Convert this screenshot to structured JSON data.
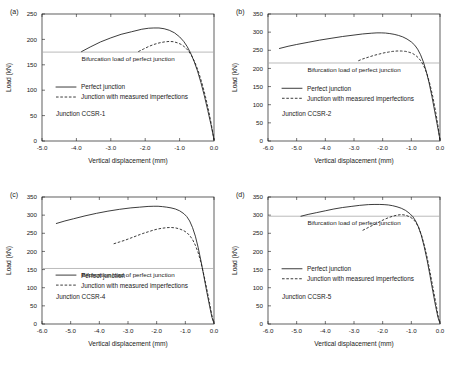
{
  "figure": {
    "background": "#ffffff",
    "axis_color": "#1a1a1a",
    "bifurcation_line_color": "#aaaaaa",
    "panel_labels": [
      "(a)",
      "(b)",
      "(c)",
      "(d)"
    ]
  },
  "chart_data": [
    {
      "type": "line",
      "panel": "(a)",
      "title": "Junction CCSR-1",
      "xlabel": "Vertical displacement (mm)",
      "ylabel": "Load (kN)",
      "xlim": [
        -5.0,
        0.0
      ],
      "ylim": [
        0,
        250
      ],
      "xticks": [
        -5.0,
        -4.0,
        -3.0,
        -2.0,
        -1.0,
        0.0
      ],
      "xticklabels": [
        "-5.0",
        "-4.0",
        "-3.0",
        "-2.0",
        "-1.0",
        "0.0"
      ],
      "yticks": [
        0,
        50,
        100,
        150,
        200,
        250
      ],
      "yticklabels": [
        "0",
        "50",
        "100",
        "150",
        "200",
        "250"
      ],
      "grid": false,
      "legend_position": "center-left",
      "annotations": [
        {
          "text": "Bifurcation load of perfect junction",
          "y_value": 175,
          "type": "hline-label"
        }
      ],
      "bifurcation_load": 175,
      "series": [
        {
          "name": "Perfect junction",
          "style": "solid",
          "x": [
            -3.85,
            -3.6,
            -3.3,
            -3.0,
            -2.7,
            -2.4,
            -2.1,
            -1.9,
            -1.75,
            -1.6,
            -1.45,
            -1.3,
            -1.15,
            -1.0,
            -0.88,
            -0.78,
            -0.68,
            -0.58,
            -0.48,
            -0.38,
            -0.28,
            -0.18,
            -0.09,
            -0.02,
            0.0
          ],
          "y": [
            176,
            185,
            195,
            203,
            210,
            215,
            220,
            222,
            222.5,
            222.5,
            221,
            218,
            213,
            205,
            196,
            186,
            173,
            157,
            138,
            115,
            89,
            60,
            33,
            10,
            2
          ]
        },
        {
          "name": "Junction with measured imperfections",
          "style": "dashed",
          "x": [
            -2.2,
            -2.05,
            -1.9,
            -1.75,
            -1.6,
            -1.45,
            -1.3,
            -1.18,
            -1.05,
            -0.95,
            -0.85,
            -0.75,
            -0.65,
            -0.55,
            -0.45,
            -0.35,
            -0.25,
            -0.15,
            -0.07,
            0.0
          ],
          "y": [
            176,
            181,
            186,
            190,
            193,
            195,
            196,
            195.5,
            193,
            190,
            185,
            178,
            168,
            154,
            136,
            114,
            88,
            58,
            30,
            2
          ]
        }
      ]
    },
    {
      "type": "line",
      "panel": "(b)",
      "title": "Junction CCSR-2",
      "xlabel": "Vertical displacement (mm)",
      "ylabel": "Load (kN)",
      "xlim": [
        -6.0,
        0.0
      ],
      "ylim": [
        0,
        350
      ],
      "xticks": [
        -6.0,
        -5.0,
        -4.0,
        -3.0,
        -2.0,
        -1.0,
        0.0
      ],
      "xticklabels": [
        "-6.0",
        "-5.0",
        "-4.0",
        "-3.0",
        "-2.0",
        "-1.0",
        "0.0"
      ],
      "yticks": [
        0,
        50,
        100,
        150,
        200,
        250,
        300,
        350
      ],
      "yticklabels": [
        "0",
        "50",
        "100",
        "150",
        "200",
        "250",
        "300",
        "350"
      ],
      "grid": false,
      "legend_position": "center-left",
      "annotations": [
        {
          "text": "Bifurcation load of perfect junction",
          "y_value": 215,
          "type": "hline-label"
        }
      ],
      "bifurcation_load": 215,
      "series": [
        {
          "name": "Perfect junction",
          "style": "solid",
          "x": [
            -5.6,
            -5.3,
            -5.0,
            -4.6,
            -4.2,
            -3.8,
            -3.4,
            -3.0,
            -2.7,
            -2.4,
            -2.2,
            -2.05,
            -1.9,
            -1.75,
            -1.6,
            -1.45,
            -1.3,
            -1.15,
            -1.0,
            -0.88,
            -0.78,
            -0.68,
            -0.58,
            -0.48,
            -0.38,
            -0.28,
            -0.18,
            -0.09,
            -0.02,
            0.0
          ],
          "y": [
            255,
            261,
            266,
            272,
            278,
            283,
            288,
            292,
            295,
            297,
            298,
            298,
            297.5,
            296,
            294,
            291,
            287,
            281,
            273,
            264,
            253,
            238,
            218,
            192,
            160,
            122,
            80,
            42,
            12,
            2
          ]
        },
        {
          "name": "Junction with measured imperfections",
          "style": "dashed",
          "x": [
            -2.85,
            -2.7,
            -2.5,
            -2.3,
            -2.1,
            -1.95,
            -1.8,
            -1.65,
            -1.5,
            -1.35,
            -1.2,
            -1.05,
            -0.95,
            -0.85,
            -0.75,
            -0.65,
            -0.55,
            -0.45,
            -0.35,
            -0.25,
            -0.15,
            -0.07,
            0.0
          ],
          "y": [
            221,
            226,
            231,
            236,
            240,
            243,
            245,
            247,
            248,
            248,
            247,
            244,
            241,
            236,
            229,
            219,
            204,
            184,
            156,
            122,
            80,
            42,
            2
          ]
        }
      ]
    },
    {
      "type": "line",
      "panel": "(c)",
      "title": "Junction CCSR-4",
      "xlabel": "Vertical displacement (mm)",
      "ylabel": "Load (kN)",
      "xlim": [
        -6.0,
        0.0
      ],
      "ylim": [
        0,
        350
      ],
      "xticks": [
        -6.0,
        -5.0,
        -4.0,
        -3.0,
        -2.0,
        -1.0,
        0.0
      ],
      "xticklabels": [
        "-6.0",
        "-5.0",
        "-4.0",
        "-3.0",
        "-2.0",
        "-1.0",
        "0.0"
      ],
      "yticks": [
        0,
        50,
        100,
        150,
        200,
        250,
        300,
        350
      ],
      "yticklabels": [
        "0",
        "50",
        "100",
        "150",
        "200",
        "250",
        "300",
        "350"
      ],
      "grid": false,
      "legend_position": "center-left",
      "annotations": [
        {
          "text": "Bifurcation load of perfect junction",
          "y_value": 153,
          "type": "hline-label"
        }
      ],
      "bifurcation_load": 153,
      "series": [
        {
          "name": "Perfect junction",
          "style": "solid",
          "x": [
            -5.5,
            -5.2,
            -4.9,
            -4.5,
            -4.1,
            -3.7,
            -3.3,
            -2.9,
            -2.6,
            -2.3,
            -2.1,
            -1.95,
            -1.8,
            -1.65,
            -1.5,
            -1.35,
            -1.2,
            -1.05,
            -0.95,
            -0.85,
            -0.75,
            -0.65,
            -0.55,
            -0.45,
            -0.35,
            -0.25,
            -0.15,
            -0.07,
            0.0
          ],
          "y": [
            277,
            284,
            290,
            298,
            305,
            311,
            316,
            320,
            322,
            324,
            324.5,
            324.5,
            323.5,
            322,
            320,
            317,
            312,
            304,
            296,
            284,
            266,
            242,
            210,
            172,
            130,
            88,
            48,
            18,
            2
          ]
        },
        {
          "name": "Junction with measured imperfections",
          "style": "dashed",
          "x": [
            -3.5,
            -3.3,
            -3.1,
            -2.9,
            -2.7,
            -2.5,
            -2.3,
            -2.1,
            -1.95,
            -1.8,
            -1.65,
            -1.5,
            -1.35,
            -1.2,
            -1.05,
            -0.95,
            -0.85,
            -0.75,
            -0.65,
            -0.55,
            -0.45,
            -0.35,
            -0.25,
            -0.15,
            -0.07,
            0.0
          ],
          "y": [
            221,
            226,
            231,
            237,
            243,
            249,
            254,
            259,
            262,
            264,
            265.5,
            266,
            265,
            262,
            257,
            252,
            244,
            233,
            217,
            196,
            168,
            134,
            96,
            56,
            22,
            2
          ]
        }
      ]
    },
    {
      "type": "line",
      "panel": "(d)",
      "title": "Junction CCSR-5",
      "xlabel": "Vertical displacement (mm)",
      "ylabel": "Load (kN)",
      "xlim": [
        -6.0,
        0.0
      ],
      "ylim": [
        0,
        350
      ],
      "xticks": [
        -6.0,
        -5.0,
        -4.0,
        -3.0,
        -2.0,
        -1.0,
        0.0
      ],
      "xticklabels": [
        "-6.0",
        "-5.0",
        "-4.0",
        "-3.0",
        "-2.0",
        "-1.0",
        "0.0"
      ],
      "yticks": [
        0,
        50,
        100,
        150,
        200,
        250,
        300,
        350
      ],
      "yticklabels": [
        "0",
        "50",
        "100",
        "150",
        "200",
        "250",
        "300",
        "350"
      ],
      "grid": false,
      "legend_position": "center-left",
      "annotations": [
        {
          "text": "Bifurcation load of perfect junction",
          "y_value": 297,
          "type": "hline-label"
        }
      ],
      "bifurcation_load": 297,
      "series": [
        {
          "name": "Perfect junction",
          "style": "solid",
          "x": [
            -4.85,
            -4.6,
            -4.3,
            -4.0,
            -3.7,
            -3.4,
            -3.1,
            -2.8,
            -2.5,
            -2.3,
            -2.1,
            -1.95,
            -1.8,
            -1.65,
            -1.5,
            -1.35,
            -1.2,
            -1.05,
            -0.95,
            -0.85,
            -0.75,
            -0.65,
            -0.55,
            -0.45,
            -0.35,
            -0.25,
            -0.15,
            -0.07,
            0.0
          ],
          "y": [
            297,
            302,
            307,
            312,
            317,
            321,
            324,
            327,
            329,
            329.5,
            329.5,
            329,
            328,
            326,
            323,
            319,
            313,
            304,
            296,
            284,
            267,
            244,
            213,
            176,
            134,
            90,
            48,
            18,
            2
          ]
        },
        {
          "name": "Junction with measured imperfections",
          "style": "dashed",
          "x": [
            -2.7,
            -2.5,
            -2.3,
            -2.1,
            -1.95,
            -1.8,
            -1.65,
            -1.5,
            -1.35,
            -1.2,
            -1.05,
            -0.95,
            -0.85,
            -0.75,
            -0.65,
            -0.55,
            -0.45,
            -0.35,
            -0.25,
            -0.15,
            -0.07,
            0.0
          ],
          "y": [
            258,
            266,
            274,
            282,
            288,
            293,
            297,
            300,
            301.5,
            300,
            295,
            290,
            281,
            267,
            246,
            218,
            184,
            144,
            102,
            60,
            24,
            2
          ]
        }
      ]
    }
  ],
  "legend": {
    "solid_label": "Perfect junction",
    "dashed_label": "Junction with measured imperfections"
  }
}
